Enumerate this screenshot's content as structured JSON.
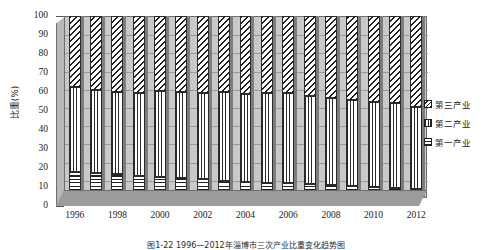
{
  "chart_data": {
    "type": "bar",
    "subtype": "stacked-100-percent-column-3d",
    "title": "",
    "caption": "图1-22  1996—2012年淄博市三次产业比重变化趋势图",
    "xlabel": "",
    "ylabel": "比重(%)",
    "ylim": [
      0,
      100
    ],
    "ytick_step": 10,
    "yticks": [
      "0",
      "10",
      "20",
      "30",
      "40",
      "50",
      "60",
      "70",
      "80",
      "90",
      "100"
    ],
    "grid": true,
    "grid_axis": "y",
    "legend_position": "right",
    "xtick_labels": [
      "1996",
      "1998",
      "2000",
      "2002",
      "2004",
      "2006",
      "2008",
      "2010",
      "2012"
    ],
    "categories": [
      "1996",
      "1997",
      "1998",
      "1999",
      "2000",
      "2001",
      "2002",
      "2003",
      "2004",
      "2005",
      "2006",
      "2007",
      "2008",
      "2009",
      "2010",
      "2011",
      "2012"
    ],
    "series": [
      {
        "name": "第一产业",
        "pattern": "horizontal-lines",
        "values": [
          14.5,
          13.5,
          13.0,
          12.0,
          11.5,
          11.0,
          10.5,
          9.5,
          9.0,
          8.5,
          8.0,
          7.5,
          7.0,
          6.5,
          6.0,
          5.5,
          5.0
        ]
      },
      {
        "name": "第二产业",
        "pattern": "vertical-lines",
        "values": [
          46.5,
          46.0,
          45.5,
          45.5,
          47.5,
          47.0,
          47.0,
          48.5,
          48.0,
          49.0,
          49.5,
          48.5,
          48.0,
          47.5,
          47.0,
          46.5,
          45.0
        ]
      },
      {
        "name": "第三产业",
        "pattern": "diagonal-hatch",
        "values": [
          39.0,
          40.5,
          41.5,
          42.5,
          41.0,
          42.0,
          42.5,
          42.0,
          43.0,
          42.5,
          42.5,
          44.0,
          45.0,
          46.0,
          47.0,
          48.0,
          50.0
        ]
      }
    ]
  },
  "legend": {
    "items": [
      {
        "label": "第三产业",
        "pattern": "tertiary"
      },
      {
        "label": "第二产业",
        "pattern": "secondary"
      },
      {
        "label": "第一产业",
        "pattern": "primary"
      }
    ]
  }
}
